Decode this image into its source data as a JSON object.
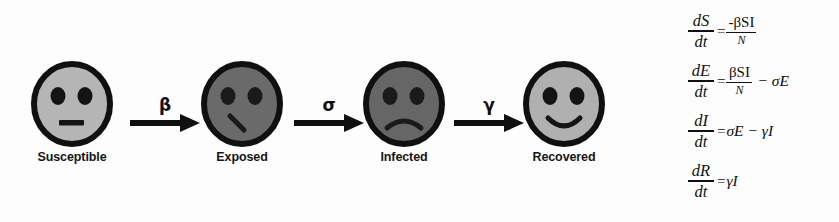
{
  "diagram": {
    "type": "SEIR compartmental model flow diagram",
    "nodes": [
      {
        "id": "susceptible",
        "label": "Susceptible",
        "face_color": "#b5b5b5",
        "mouth": "neutral-flat",
        "x": 28
      },
      {
        "id": "exposed",
        "label": "Exposed",
        "face_color": "#6a6a6a",
        "mouth": "slanted-line",
        "x": 198
      },
      {
        "id": "infected",
        "label": "Infected",
        "face_color": "#666666",
        "mouth": "frown",
        "x": 360
      },
      {
        "id": "recovered",
        "label": "Recovered",
        "face_color": "#b0b0b0",
        "mouth": "smile",
        "x": 520
      }
    ],
    "arrows": [
      {
        "id": "s-to-e",
        "label": "β",
        "name": "beta",
        "from": "susceptible",
        "to": "exposed",
        "x": 128
      },
      {
        "id": "e-to-i",
        "label": "σ",
        "name": "sigma",
        "from": "exposed",
        "to": "infected",
        "x": 292
      },
      {
        "id": "i-to-r",
        "label": "γ",
        "name": "gamma",
        "from": "infected",
        "to": "recovered",
        "x": 452
      }
    ],
    "outline_color": "#101010",
    "eye_color": "#141414"
  },
  "equations": [
    {
      "id": "dS-dt",
      "lhs_num": "dS",
      "lhs_den": "dt",
      "equals": "=",
      "rhs_num": "-βSI",
      "rhs_den": "N",
      "rhs_tail": "",
      "has_fraction": true
    },
    {
      "id": "dE-dt",
      "lhs_num": "dE",
      "lhs_den": "dt",
      "equals": "=",
      "rhs_num": "βSI",
      "rhs_den": "N",
      "rhs_tail": "− σE",
      "has_fraction": true
    },
    {
      "id": "dI-dt",
      "lhs_num": "dI",
      "lhs_den": "dt",
      "equals": "=",
      "rhs_inline": "σE − γI",
      "has_fraction": false
    },
    {
      "id": "dR-dt",
      "lhs_num": "dR",
      "lhs_den": "dt",
      "equals": "=",
      "rhs_inline": "γI",
      "has_fraction": false
    }
  ]
}
